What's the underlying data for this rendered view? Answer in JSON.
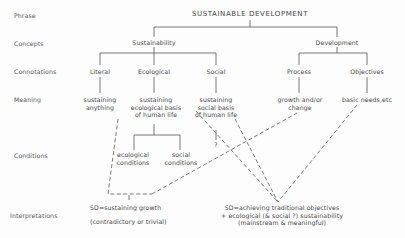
{
  "diagram": {
    "row_labels": [
      "Phrase",
      "Concepts",
      "Connotations",
      "Meaning",
      "Conditions",
      "Interpretations"
    ],
    "phrase": "SUSTAINABLE DEVELOPMENT",
    "concepts": {
      "sustainability": "Sustainability",
      "development": "Development"
    },
    "connotations": {
      "literal": "Literal",
      "ecological": "Ecological",
      "social": "Social",
      "process": "Process",
      "objectives": "Objectives"
    },
    "meanings": {
      "literal": [
        "sustaining",
        "anything"
      ],
      "ecological": [
        "sustaining",
        "ecological basis",
        "of human life"
      ],
      "social": [
        "sustaining",
        "social basis",
        "of human life"
      ],
      "process": [
        "growth and/or",
        "change"
      ],
      "objectives": [
        "basic needs,etc"
      ]
    },
    "conditions": {
      "ecological": [
        "ecological",
        "conditions"
      ],
      "social": [
        "social",
        "conditions"
      ],
      "social_unknown": "?"
    },
    "interpretations": {
      "growth": {
        "line1": "SD=sustaining growth",
        "line2": "(contradictory or trivial)"
      },
      "traditional": {
        "line1": "SD=achieving traditional objectives",
        "line2": "+ ecological (& social ?) sustainability",
        "line3": "(mainstream & meaningful)"
      }
    },
    "colors": {
      "line": "#555555",
      "text": "#444444",
      "background": "#fdfdfd"
    }
  }
}
